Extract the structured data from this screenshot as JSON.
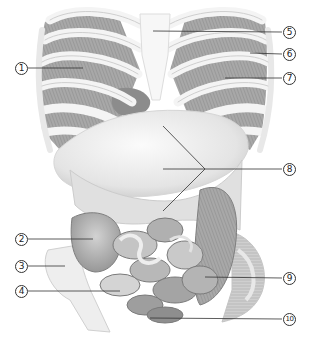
{
  "figure": {
    "palette": {
      "background": "#ffffff",
      "bone": "#f2f2f2",
      "bone_shadow": "#c8c8c8",
      "muscle": "#9a9a9a",
      "organ_light": "#e6e6e6",
      "organ_mid": "#bcbcbc",
      "organ_dark": "#8f8f8f",
      "leader_line": "#333333"
    }
  },
  "callouts": [
    {
      "id": "1",
      "label": "1",
      "side": "left",
      "cx": 21,
      "cy": 68,
      "line": [
        [
          28,
          68
        ],
        [
          83,
          68
        ]
      ]
    },
    {
      "id": "2",
      "label": "2",
      "side": "left",
      "cx": 21,
      "cy": 239,
      "line": [
        [
          28,
          239
        ],
        [
          93,
          239
        ]
      ]
    },
    {
      "id": "3",
      "label": "3",
      "side": "left",
      "cx": 21,
      "cy": 266,
      "line": [
        [
          28,
          266
        ],
        [
          65,
          266
        ]
      ]
    },
    {
      "id": "4",
      "label": "4",
      "side": "left",
      "cx": 21,
      "cy": 291,
      "line": [
        [
          28,
          291
        ],
        [
          120,
          291
        ]
      ]
    },
    {
      "id": "5",
      "label": "5",
      "side": "right",
      "cx": 289,
      "cy": 32,
      "line": [
        [
          153,
          31
        ],
        [
          282,
          32
        ]
      ]
    },
    {
      "id": "6",
      "label": "6",
      "side": "right",
      "cx": 289,
      "cy": 54,
      "line": [
        [
          250,
          53
        ],
        [
          282,
          54
        ]
      ]
    },
    {
      "id": "7",
      "label": "7",
      "side": "right",
      "cx": 289,
      "cy": 78,
      "line": [
        [
          225,
          78
        ],
        [
          282,
          78
        ]
      ]
    },
    {
      "id": "8",
      "label": "8",
      "side": "right",
      "cx": 289,
      "cy": 169,
      "line": [
        [
          205,
          169
        ],
        [
          282,
          169
        ]
      ],
      "extra_lines": [
        [
          [
            163,
            169
          ],
          [
            205,
            169
          ]
        ],
        [
          [
            163,
            126
          ],
          [
            205,
            169
          ]
        ],
        [
          [
            163,
            211
          ],
          [
            205,
            169
          ]
        ]
      ]
    },
    {
      "id": "9",
      "label": "9",
      "side": "right",
      "cx": 289,
      "cy": 278,
      "line": [
        [
          205,
          277
        ],
        [
          282,
          278
        ]
      ]
    },
    {
      "id": "10",
      "label": "10",
      "side": "right",
      "cx": 289,
      "cy": 319,
      "line": [
        [
          150,
          318
        ],
        [
          282,
          319
        ]
      ]
    }
  ]
}
